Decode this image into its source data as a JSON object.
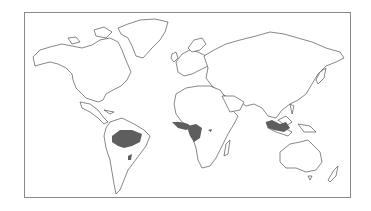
{
  "map": {
    "type": "world outline map",
    "highlight_meaning": "tropical rainforest regions",
    "highlight_color": "#5e5e5e",
    "outline_color": "#555555",
    "frame_color": "#8a8a8a",
    "highlighted_regions": [
      "Amazon Basin (South America)",
      "Atlantic coast Brazil",
      "West Africa coast",
      "Congo Basin (Central Africa)",
      "Madagascar east coast",
      "Southeast Asia / Indonesia"
    ]
  }
}
